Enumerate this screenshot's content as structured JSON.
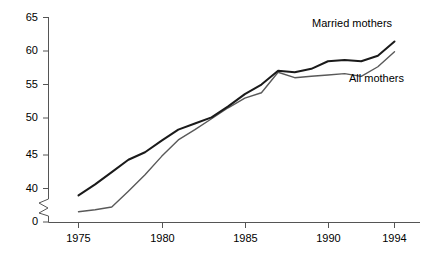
{
  "chart_data": {
    "type": "line",
    "title": "",
    "subtitle": "",
    "xlabel": "",
    "ylabel": "",
    "xlim": [
      1975,
      1994
    ],
    "ylim": [
      35,
      65
    ],
    "y_axis_break": true,
    "y_axis_break_note": "zigzag break between 0 and 40",
    "grid": false,
    "legend_position": "inline-annotations",
    "y_ticks": [
      0,
      40,
      45,
      50,
      55,
      60,
      65
    ],
    "y_tick_labels": [
      "0",
      "40",
      "45",
      "50",
      "55",
      "60",
      "65"
    ],
    "x_ticks": [
      1975,
      1980,
      1985,
      1990,
      1994
    ],
    "x_tick_labels": [
      "1975",
      "1980",
      "1985",
      "1990",
      "1994"
    ],
    "x": [
      1975,
      1976,
      1977,
      1978,
      1979,
      1980,
      1981,
      1982,
      1983,
      1984,
      1985,
      1986,
      1987,
      1988,
      1989,
      1990,
      1991,
      1992,
      1993,
      1994
    ],
    "series": [
      {
        "name": "Married mothers",
        "label": "Married mothers",
        "color": "#1a1a1a",
        "width": 2.0,
        "values": [
          39.0,
          40.6,
          42.4,
          44.2,
          45.3,
          47.0,
          48.6,
          49.5,
          50.4,
          52.0,
          53.8,
          55.2,
          57.2,
          57.0,
          57.5,
          58.6,
          58.8,
          58.6,
          59.4,
          61.5
        ]
      },
      {
        "name": "All mothers",
        "label": "All mothers",
        "color": "#595959",
        "width": 1.4,
        "values": [
          36.6,
          36.9,
          37.3,
          39.6,
          42.0,
          44.7,
          47.1,
          48.6,
          50.2,
          51.8,
          53.2,
          54.0,
          57.0,
          56.2,
          56.4,
          56.6,
          56.8,
          56.4,
          57.8,
          60.0
        ]
      }
    ],
    "annotations": [
      {
        "text": "Married mothers",
        "x_px": 312,
        "y_px": 18
      },
      {
        "text": "All mothers",
        "x_px": 349,
        "y_px": 73
      }
    ]
  },
  "axis": {
    "y_labels": [
      "65",
      "60",
      "55",
      "50",
      "45",
      "40",
      "0"
    ],
    "x_labels": [
      "1975",
      "1980",
      "1985",
      "1990",
      "1994"
    ]
  },
  "colors": {
    "background": "#ffffff",
    "axis": "#555555",
    "series_married": "#1a1a1a",
    "series_all": "#595959",
    "text": "#000000"
  }
}
